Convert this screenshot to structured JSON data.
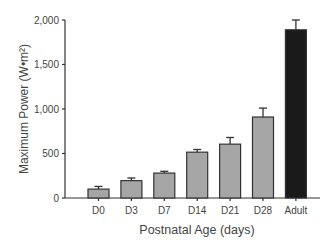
{
  "chart_data": {
    "type": "bar",
    "title": "",
    "xlabel": "Postnatal Age (days)",
    "ylabel": "Maximum Power (W•m²)",
    "categories": [
      "D0",
      "D3",
      "D7",
      "D14",
      "D21",
      "D28",
      "Adult"
    ],
    "values": [
      100,
      195,
      280,
      515,
      605,
      910,
      1890
    ],
    "error_upper": [
      130,
      225,
      300,
      545,
      680,
      1010,
      2000
    ],
    "colors": [
      "#a6a6a6",
      "#a6a6a6",
      "#a6a6a6",
      "#a6a6a6",
      "#a6a6a6",
      "#a6a6a6",
      "#1a1a1a"
    ],
    "ylim": [
      0,
      2000
    ],
    "yticks": [
      0,
      500,
      1000,
      1500,
      2000
    ],
    "ytick_labels": [
      "0",
      "500",
      "1,000",
      "1,500",
      "2,000"
    ],
    "grid": false,
    "legend": null,
    "error_bars": "upper, mean + SE/SD"
  },
  "style": {
    "bar_stroke": "#333333",
    "axis_color": "#333333",
    "text_color": "#444444"
  }
}
